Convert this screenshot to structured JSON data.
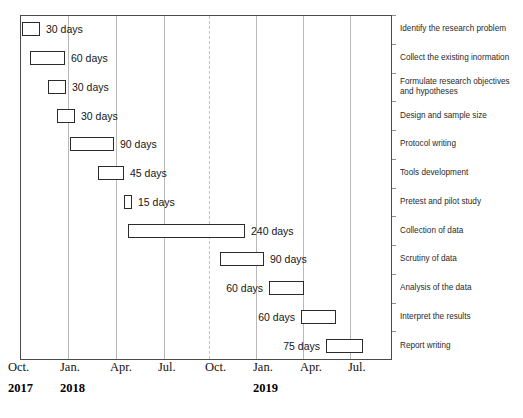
{
  "chart_data": {
    "type": "bar",
    "orientation": "horizontal",
    "subtype": "gantt",
    "title": "",
    "xlabel": "",
    "ylabel": "",
    "grid": true,
    "legend": "none",
    "axis": {
      "month_ticks": [
        "Oct.",
        "Jan.",
        "Apr.",
        "Jul.",
        "Oct.",
        "Jan.",
        "Apr.",
        "Jul."
      ],
      "year_ticks": [
        "2017",
        "2018",
        "2019"
      ],
      "xlim": [
        "Oct. 2017",
        "Sep. 2019"
      ]
    },
    "categories": [
      "Identify the research problem",
      "Collect the existing inormation",
      "Formulate research objectives\nand hypotheses",
      "Design and sample size",
      "Protocol writing",
      "Tools development",
      "Pretest and pilot study",
      "Collection of data",
      "Scrutiny of data",
      "Analysis of the data",
      "Interpret the results",
      "Report writing"
    ],
    "tasks": [
      {
        "task": "Identify the research problem",
        "duration_days": 30,
        "label": "30 days",
        "label_side": "right",
        "start_px": 2,
        "width_px": 18
      },
      {
        "task": "Collect the existing inormation",
        "duration_days": 60,
        "label": "60 days",
        "label_side": "right",
        "start_px": 10,
        "width_px": 35
      },
      {
        "task": "Formulate research objectives\nand hypotheses",
        "duration_days": 30,
        "label": "30 days",
        "label_side": "right",
        "start_px": 28,
        "width_px": 18
      },
      {
        "task": "Design and sample size",
        "duration_days": 30,
        "label": "30 days",
        "label_side": "right",
        "start_px": 37,
        "width_px": 18
      },
      {
        "task": "Protocol writing",
        "duration_days": 90,
        "label": "90 days",
        "label_side": "right",
        "start_px": 50,
        "width_px": 44
      },
      {
        "task": "Tools development",
        "duration_days": 45,
        "label": "45 days",
        "label_side": "right",
        "start_px": 78,
        "width_px": 26
      },
      {
        "task": "Pretest and pilot study",
        "duration_days": 15,
        "label": "15 days",
        "label_side": "right",
        "start_px": 104,
        "width_px": 8
      },
      {
        "task": "Collection of data",
        "duration_days": 240,
        "label": "240 days",
        "label_side": "right",
        "start_px": 108,
        "width_px": 117
      },
      {
        "task": "Scrutiny of data",
        "duration_days": 90,
        "label": "90 days",
        "label_side": "right",
        "start_px": 200,
        "width_px": 44
      },
      {
        "task": "Analysis of the data",
        "duration_days": 60,
        "label": "60 days",
        "label_side": "left",
        "start_px": 249,
        "width_px": 35
      },
      {
        "task": "Interpret the results",
        "duration_days": 60,
        "label": "60 days",
        "label_side": "left",
        "start_px": 281,
        "width_px": 35
      },
      {
        "task": "Report writing",
        "duration_days": 75,
        "label": "75 days",
        "label_side": "left",
        "start_px": 306,
        "width_px": 37
      }
    ],
    "gridlines_px": [
      47,
      95,
      143,
      188,
      235,
      282,
      329
    ],
    "colors": {
      "bar_fill": "#ffffff",
      "bar_stroke": "#2b2b2b",
      "frame": "#4a4a4a",
      "gridline": "#b9b9b9",
      "text": "#1a1a1a",
      "background": "#ffffff"
    }
  },
  "axis_positions": {
    "months_px": [
      8,
      60,
      110,
      158,
      205,
      253,
      300,
      348
    ],
    "years_px": [
      8,
      60,
      253
    ]
  }
}
